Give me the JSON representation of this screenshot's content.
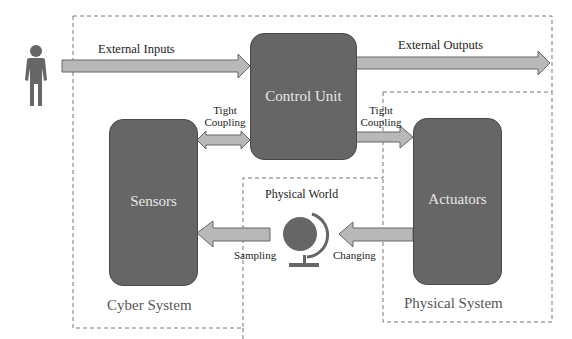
{
  "diagram": {
    "actor": {
      "icon": "person-icon",
      "color": "#666666"
    },
    "blocks": {
      "control_unit": "Control Unit",
      "sensors": "Sensors",
      "actuators": "Actuators"
    },
    "arrows": {
      "external_inputs": "External Inputs",
      "external_outputs": "External Outputs",
      "tight_coupling_left_1": "Tight",
      "tight_coupling_left_2": "Coupling",
      "tight_coupling_right_1": "Tight",
      "tight_coupling_right_2": "Coupling",
      "sampling": "Sampling",
      "changing": "Changing"
    },
    "physical_world": {
      "label": "Physical World",
      "icon": "globe-icon"
    },
    "regions": {
      "cyber_system": "Cyber System",
      "physical_system": "Physical System"
    },
    "colors": {
      "block_fill": "#666666",
      "arrow_fill": "#b8b8b8",
      "arrow_stroke": "#666666",
      "dashed_border": "#777777"
    }
  }
}
